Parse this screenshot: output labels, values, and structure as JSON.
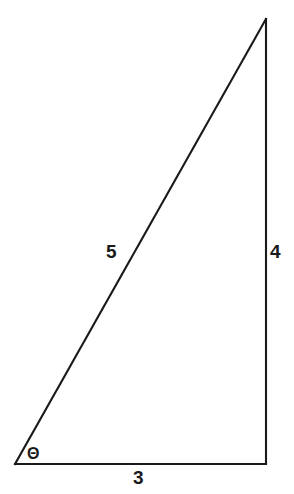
{
  "figure": {
    "background_color": "#ffffff",
    "stroke_color": "#1a1a1a",
    "canvas": {
      "width": 294,
      "height": 494
    }
  },
  "chart_data": {
    "type": "diagram",
    "shape": "right-triangle",
    "title": "",
    "vertices": [
      {
        "name": "bottom-left",
        "x": 15,
        "y": 464
      },
      {
        "name": "bottom-right",
        "x": 266,
        "y": 464
      },
      {
        "name": "apex-top-right",
        "x": 266,
        "y": 19
      }
    ],
    "sides": [
      {
        "name": "base",
        "label": "3",
        "value": 3,
        "from": "bottom-left",
        "to": "bottom-right"
      },
      {
        "name": "vertical-leg",
        "label": "4",
        "value": 4,
        "from": "bottom-right",
        "to": "apex-top-right"
      },
      {
        "name": "hypotenuse",
        "label": "5",
        "value": 5,
        "from": "bottom-left",
        "to": "apex-top-right"
      }
    ],
    "angles": [
      {
        "name": "theta",
        "label": "Θ",
        "at": "bottom-left"
      }
    ],
    "annotations": [
      "3",
      "4",
      "5",
      "Θ"
    ]
  },
  "labels": {
    "hypotenuse": "5",
    "vertical": "4",
    "base": "3",
    "angle": "Θ"
  }
}
